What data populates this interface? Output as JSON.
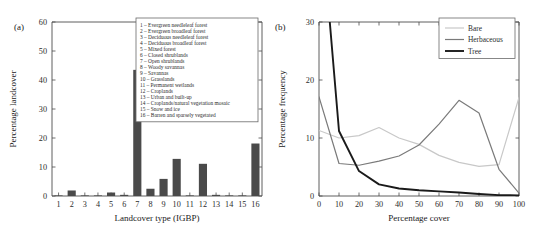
{
  "figure": {
    "panel_a_label": "(a)",
    "panel_b_label": "(b)"
  },
  "colors": {
    "bar": "#4a4a4a",
    "axis": "#4c4c4c",
    "bare": "#c8c8c8",
    "herbaceous": "#7a7a7a",
    "tree": "#1a1a1a"
  },
  "chart_data": [
    {
      "type": "bar",
      "panel": "(a)",
      "title": "",
      "xlabel": "Landcover type (IGBP)",
      "ylabel": "Percentage landcover",
      "categories": [
        "1",
        "2",
        "3",
        "4",
        "5",
        "6",
        "7",
        "8",
        "9",
        "10",
        "11",
        "12",
        "13",
        "14",
        "15",
        "16"
      ],
      "values": [
        0.1,
        1.9,
        0.05,
        0.05,
        1.2,
        0.4,
        43.5,
        2.5,
        5.9,
        12.8,
        0.1,
        11.1,
        0.4,
        0.1,
        0.1,
        18.1
      ],
      "xlim": [
        0.5,
        16.5
      ],
      "ylim": [
        0,
        60
      ],
      "yticks": [
        0,
        10,
        20,
        30,
        40,
        50,
        60
      ],
      "grid": false,
      "legend_position": "upper-right",
      "legend_entries": [
        "1 – Evergreen needleleaf forest",
        "2 – Evergreen broadleaf forest",
        "3 – Deciduous needleleaf forest",
        "4 – Deciduous broadleaf forest",
        "5 – Mixed forest",
        "6 – Closed shrublands",
        "7 – Open shrublands",
        "8 – Woody savannas",
        "9 – Savannas",
        "10 – Grasslands",
        "11 – Permanent wetlands",
        "12 – Croplands",
        "13 – Urban and built-up",
        "14 – Croplands/natural vegetation mosaic",
        "15 – Snow and ice",
        "16 – Barren and sparsely vegetated"
      ]
    },
    {
      "type": "line",
      "panel": "(b)",
      "title": "",
      "xlabel": "Percentage cover",
      "ylabel": "Percentage frequency",
      "x": [
        0,
        10,
        20,
        30,
        40,
        50,
        60,
        70,
        80,
        90,
        100
      ],
      "series": [
        {
          "name": "Bare",
          "color": "#c8c8c8",
          "values": [
            11.3,
            10.0,
            10.4,
            11.8,
            10.0,
            8.9,
            7.0,
            5.8,
            5.1,
            5.4,
            17.0
          ]
        },
        {
          "name": "Herbaceous",
          "color": "#7a7a7a",
          "values": [
            17.1,
            5.6,
            5.3,
            6.0,
            6.9,
            8.8,
            12.4,
            16.5,
            14.3,
            4.6,
            0.5
          ]
        },
        {
          "name": "Tree",
          "color": "#1a1a1a",
          "values": [
            52.0,
            11.2,
            4.3,
            2.0,
            1.3,
            1.0,
            0.8,
            0.6,
            0.35,
            0.15,
            0.1
          ]
        }
      ],
      "xlim": [
        0,
        100
      ],
      "ylim": [
        0,
        30
      ],
      "xticks": [
        0,
        10,
        20,
        30,
        40,
        50,
        60,
        70,
        80,
        90,
        100
      ],
      "yticks": [
        0,
        10,
        20,
        30
      ],
      "grid": false,
      "legend_position": "upper-right"
    }
  ]
}
